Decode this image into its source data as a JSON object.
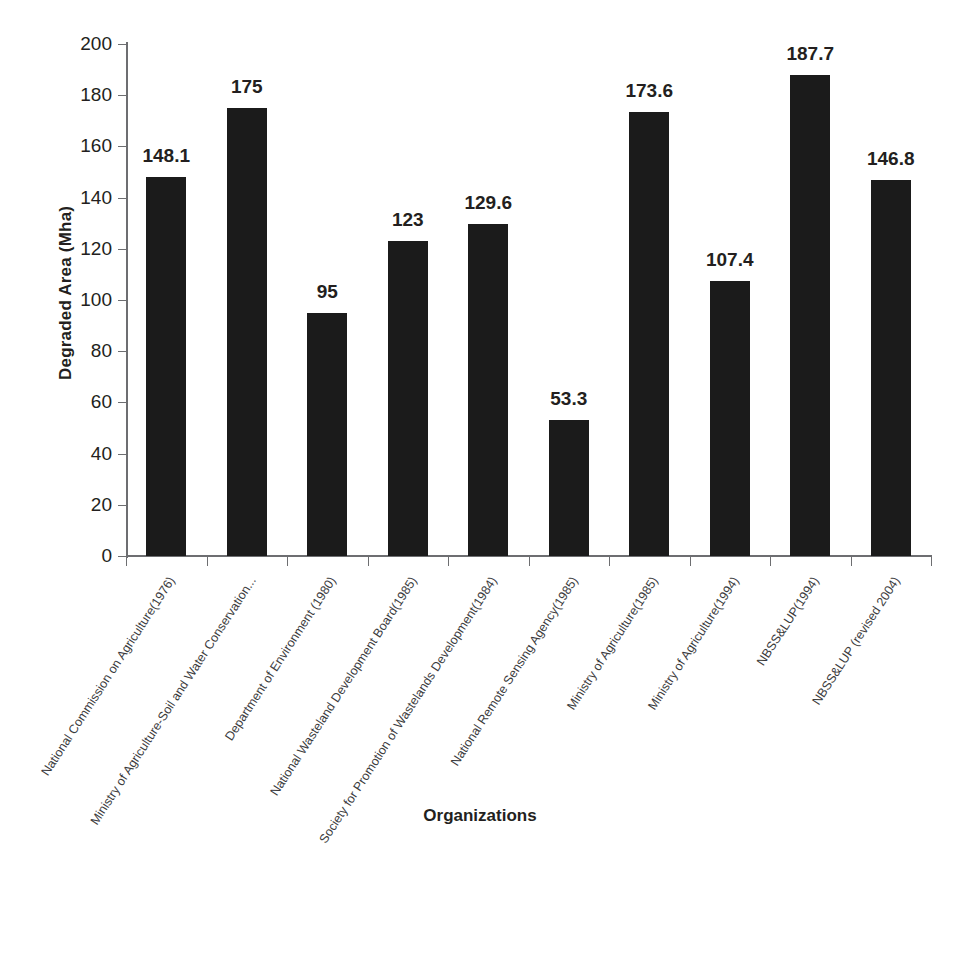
{
  "chart_data": {
    "type": "bar",
    "title": "",
    "xlabel": "Organizations",
    "ylabel": "Degraded Area (Mha)",
    "ylim": [
      0,
      200
    ],
    "ytick_step": 20,
    "yticks": [
      0,
      20,
      40,
      60,
      80,
      100,
      120,
      140,
      160,
      180,
      200
    ],
    "ytick_labels": [
      "0",
      "20",
      "40",
      "60",
      "80",
      "100",
      "120",
      "140",
      "160",
      "180",
      "200"
    ],
    "grid": false,
    "legend": false,
    "bar_color": "#1b1b1b",
    "categories": [
      "National Commission on Agriculture(1976)",
      "Ministry of Agriculture-Soil and  Water Conservation...",
      "Department of Environment (1980)",
      "National Wasteland Development Board(1985)",
      "Society for Promotion of  Wastelands Development(1984)",
      "National Remote Sensing Agency(1985)",
      "Ministry of Agriculture(1985)",
      "Ministry of Agriculture(1994)",
      "NBSS&LUP(1994)",
      "NBSS&LUP (revised 2004)"
    ],
    "values": [
      148.1,
      175,
      95,
      123,
      129.6,
      53.3,
      173.6,
      107.4,
      187.7,
      146.8
    ],
    "value_labels": [
      "148.1",
      "175",
      "95",
      "123",
      "129.6",
      "53.3",
      "173.6",
      "107.4",
      "187.7",
      "146.8"
    ]
  }
}
